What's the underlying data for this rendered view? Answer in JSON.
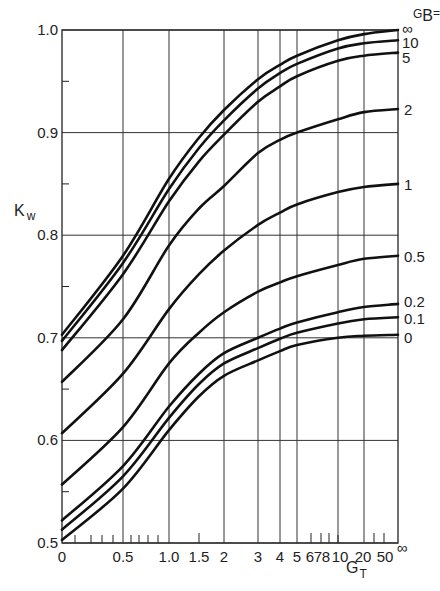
{
  "chart_data": {
    "type": "line",
    "title": "",
    "xlabel": "G_T",
    "ylabel": "K_w",
    "legend_title": "G_B =",
    "x_scale": "nonlinear (compressed, 0 to ∞)",
    "x_ticks": [
      {
        "label": "0",
        "value": 0
      },
      {
        "label": "0.5",
        "value": 0.5
      },
      {
        "label": "1.0",
        "value": 1.0
      },
      {
        "label": "1.5",
        "value": 1.5
      },
      {
        "label": "2",
        "value": 2
      },
      {
        "label": "3",
        "value": 3
      },
      {
        "label": "4",
        "value": 4
      },
      {
        "label": "5",
        "value": 5
      },
      {
        "label": "6",
        "value": 6
      },
      {
        "label": "7",
        "value": 7
      },
      {
        "label": "8",
        "value": 8
      },
      {
        "label": "10",
        "value": 10
      },
      {
        "label": "20",
        "value": 20
      },
      {
        "label": "50",
        "value": 50
      },
      {
        "label": "∞",
        "value": "inf"
      }
    ],
    "y_ticks": [
      "0.5",
      "0.6",
      "0.7",
      "0.8",
      "0.9",
      "1.0"
    ],
    "ylim": [
      0.5,
      1.0
    ],
    "grid": true,
    "x": [
      "0",
      "0.5",
      "1.0",
      "1.5",
      "2",
      "3",
      "4",
      "5",
      "10",
      "20",
      "∞"
    ],
    "series": [
      {
        "name": "∞",
        "values": [
          0.703,
          0.78,
          0.855,
          0.895,
          0.922,
          0.952,
          0.966,
          0.975,
          0.99,
          0.996,
          1.0
        ]
      },
      {
        "name": "10",
        "values": [
          0.697,
          0.773,
          0.845,
          0.885,
          0.912,
          0.943,
          0.958,
          0.967,
          0.982,
          0.987,
          0.99
        ]
      },
      {
        "name": "5",
        "values": [
          0.688,
          0.762,
          0.833,
          0.872,
          0.898,
          0.93,
          0.945,
          0.955,
          0.97,
          0.975,
          0.978
        ]
      },
      {
        "name": "2",
        "values": [
          0.657,
          0.718,
          0.79,
          0.826,
          0.848,
          0.88,
          0.893,
          0.9,
          0.913,
          0.92,
          0.923
        ]
      },
      {
        "name": "1",
        "values": [
          0.607,
          0.665,
          0.728,
          0.762,
          0.785,
          0.81,
          0.822,
          0.83,
          0.842,
          0.847,
          0.85
        ]
      },
      {
        "name": "0.5",
        "values": [
          0.557,
          0.613,
          0.675,
          0.705,
          0.725,
          0.745,
          0.754,
          0.76,
          0.771,
          0.777,
          0.78
        ]
      },
      {
        "name": "0.2",
        "values": [
          0.522,
          0.575,
          0.633,
          0.665,
          0.685,
          0.7,
          0.709,
          0.715,
          0.725,
          0.73,
          0.733
        ]
      },
      {
        "name": "0.1",
        "values": [
          0.513,
          0.565,
          0.622,
          0.655,
          0.675,
          0.69,
          0.699,
          0.705,
          0.714,
          0.718,
          0.72
        ]
      },
      {
        "name": "0",
        "values": [
          0.503,
          0.553,
          0.61,
          0.643,
          0.663,
          0.678,
          0.687,
          0.693,
          0.7,
          0.702,
          0.703
        ]
      }
    ]
  },
  "labels": {
    "y_axis_main": "K",
    "y_axis_sub": "w",
    "x_axis_main": "G",
    "x_axis_sub": "T",
    "legend_main": "G",
    "legend_sub": "B",
    "legend_eq": "="
  }
}
